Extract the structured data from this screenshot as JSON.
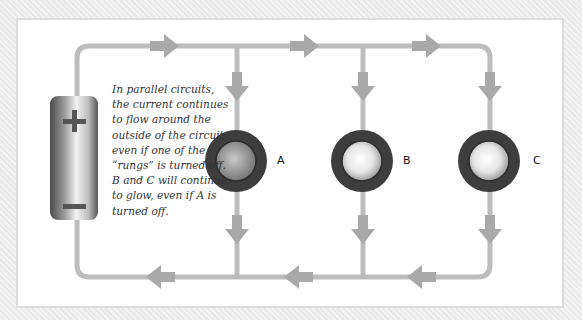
{
  "diagram": {
    "title": "Parallel circuit",
    "caption": "In parallel circuits, the current continues to flow around the outside of the circuit even if one of the “rungs” is turned off. B and C will continue to glow, even if A is turned off.",
    "battery": {
      "positive_symbol": "+",
      "negative_symbol": "−"
    },
    "bulbs": [
      {
        "label": "A",
        "state": "dim"
      },
      {
        "label": "B",
        "state": "lit"
      },
      {
        "label": "C",
        "state": "lit"
      }
    ],
    "colors": {
      "wire": "#b9b9b9",
      "arrow": "#a9a9a9",
      "bulb_ring": "#3d3d3d",
      "panel": "#ffffff",
      "background": "#eeeeee"
    }
  }
}
